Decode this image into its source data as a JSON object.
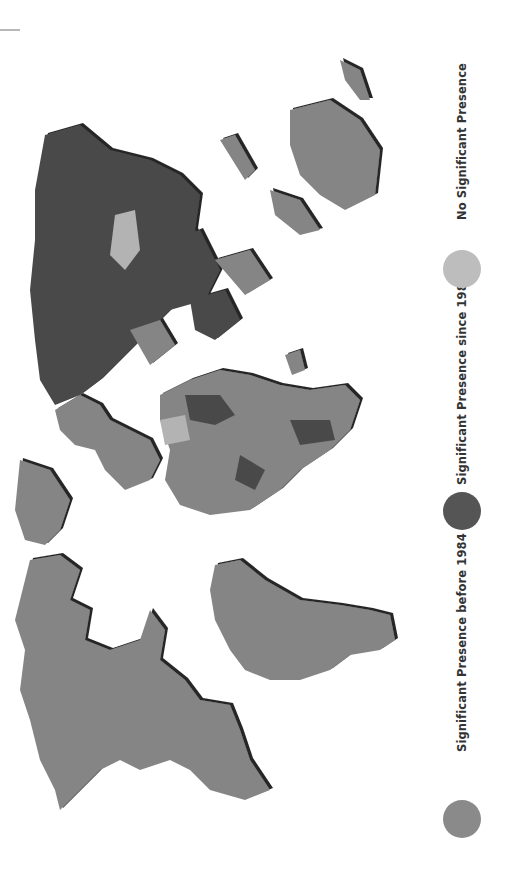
{
  "map": {
    "title": "World map of significant presence",
    "orientation": "rotated 90 degrees clockwise (north at left)",
    "colors": {
      "before_1984": "#858585",
      "since_1984": "#4a4a4a",
      "none": "#b3b3b3",
      "shadow": "#1a1a1a",
      "background": "#ffffff"
    },
    "regions": {
      "north_america": "before_1984",
      "south_america": "before_1984",
      "europe": "before_1984",
      "russia": "since_1984",
      "china": "since_1984",
      "mongolia": "none",
      "africa_majority": "before_1984",
      "australia": "before_1984",
      "greenland": "before_1984"
    }
  },
  "legend": {
    "items": [
      {
        "label": "Significant Presence before 1984",
        "color": "#858585"
      },
      {
        "label": "Significant Presence since 1984",
        "color": "#4a4a4a"
      },
      {
        "label": "No Significant Presence",
        "color": "#b3b3b3"
      }
    ]
  }
}
